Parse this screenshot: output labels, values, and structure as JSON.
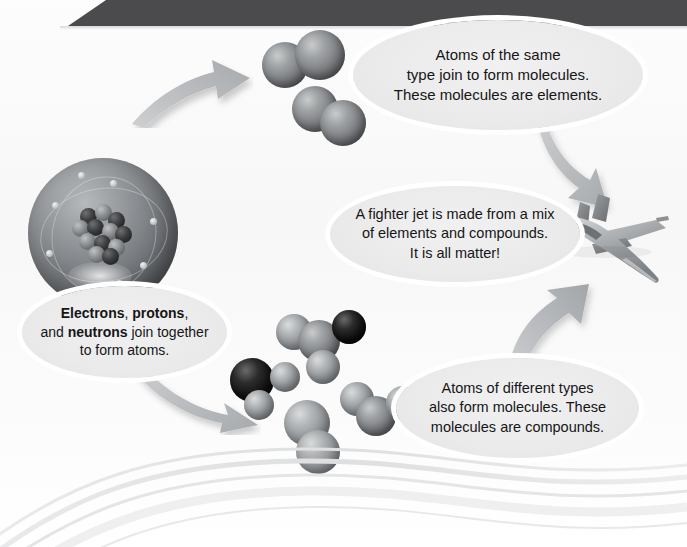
{
  "page": {
    "header_bar_color": "#4b4b4d",
    "background_color": "#fafafa",
    "callout_fill": "#eaeaeb",
    "callout_rim": "#ffffff",
    "text_color": "#161616",
    "sphere_gray": "#77797c",
    "sphere_light": "#8c8f92",
    "sphere_dark": "#121212",
    "arrow_color": "#b9bbbd"
  },
  "callouts": {
    "elements": {
      "name": "elements-callout",
      "lines": [
        "Atoms of the same",
        "type join to form molecules.",
        "These molecules are elements."
      ]
    },
    "jet": {
      "name": "jet-callout",
      "lines": [
        "A fighter jet is made from a mix",
        "of elements and compounds.",
        "It is all matter!"
      ]
    },
    "atoms": {
      "name": "atoms-callout",
      "rich_lines": [
        [
          {
            "t": "Electrons",
            "b": true
          },
          {
            "t": ", ",
            "b": false
          },
          {
            "t": "protons",
            "b": true
          },
          {
            "t": ",",
            "b": false
          }
        ],
        [
          {
            "t": "and ",
            "b": false
          },
          {
            "t": "neutrons",
            "b": true
          },
          {
            "t": " join together",
            "b": false
          }
        ],
        [
          {
            "t": "to form atoms.",
            "b": false
          }
        ]
      ],
      "plain": "Electrons, protons, and neutrons join together to form atoms."
    },
    "compounds": {
      "name": "compounds-callout",
      "lines": [
        "Atoms of different types",
        "also form molecules. These",
        "molecules are compounds."
      ]
    }
  },
  "illustrations": {
    "atom": {
      "label": "atom-illustration",
      "shell_label": "electron-shell",
      "nucleus_label": "nucleus",
      "electron_count": 8,
      "proton_count": 7,
      "neutron_count": 6
    },
    "element_molecules": {
      "label": "element-molecules",
      "description": "two diatomic molecules of identical gray atoms",
      "molecules": [
        {
          "atoms": [
            "gray",
            "gray"
          ]
        },
        {
          "atoms": [
            "gray",
            "gray"
          ]
        }
      ]
    },
    "compound_molecules": {
      "label": "compound-molecules",
      "description": "four molecules combining dark and gray atoms",
      "molecules": [
        {
          "atoms": [
            "light",
            "gray",
            "dark",
            "light"
          ]
        },
        {
          "atoms": [
            "dark",
            "light",
            "light"
          ]
        },
        {
          "atoms": [
            "light",
            "gray",
            "light"
          ]
        },
        {
          "atoms": [
            "light",
            "light"
          ]
        }
      ]
    },
    "jet": {
      "label": "fighter-jet",
      "description": "gray fighter jet banking toward lower right"
    }
  },
  "arrows": [
    {
      "name": "arrow-atoms-to-elements",
      "direction": "up-right"
    },
    {
      "name": "arrow-elements-to-jet",
      "direction": "down-right"
    },
    {
      "name": "arrow-compounds-to-jet",
      "direction": "up-right"
    },
    {
      "name": "arrow-atoms-to-compounds",
      "direction": "down-right"
    }
  ],
  "decoration": {
    "bottom_swoosh": "layered light gray curved bands across the lower page"
  }
}
